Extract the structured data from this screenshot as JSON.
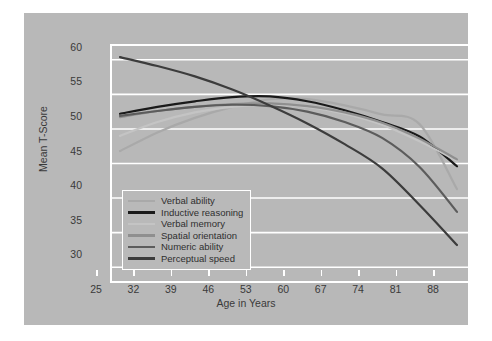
{
  "chart_data": {
    "type": "line",
    "title": "",
    "xlabel": "Age in Years",
    "ylabel": "Mean T-Score",
    "xticks": [
      25,
      32,
      39,
      46,
      53,
      60,
      67,
      74,
      81,
      88
    ],
    "yticks": [
      30,
      35,
      40,
      45,
      50,
      55,
      60
    ],
    "xlim": [
      25,
      88
    ],
    "ylim": [
      28,
      62
    ],
    "grid": true,
    "legend_position": "lower-left-inside",
    "x": [
      25,
      32,
      39,
      46,
      53,
      60,
      67,
      74,
      81,
      88
    ],
    "series": [
      {
        "name": "Verbal ability",
        "color": "#a9a9a9",
        "values": [
          46.8,
          49.5,
          51.6,
          53.2,
          54.3,
          54.3,
          53.4,
          52.1,
          50.7,
          41.3
        ]
      },
      {
        "name": "Inductive reasoning",
        "color": "#1a1a1a",
        "values": [
          52.2,
          53.2,
          54.0,
          54.6,
          54.7,
          54.0,
          52.7,
          51.0,
          48.9,
          44.6
        ]
      },
      {
        "name": "Verbal memory",
        "color": "#c4c4c4",
        "values": [
          49.0,
          51.0,
          52.4,
          53.2,
          53.5,
          53.2,
          52.2,
          50.6,
          48.2,
          45.4
        ]
      },
      {
        "name": "Spatial orientation",
        "color": "#8f8f8f",
        "values": [
          51.7,
          52.6,
          53.2,
          53.6,
          53.7,
          53.3,
          52.4,
          50.9,
          48.6,
          45.6
        ]
      },
      {
        "name": "Numeric ability",
        "color": "#5c5c5c",
        "values": [
          51.9,
          52.6,
          53.2,
          53.5,
          53.3,
          52.5,
          51.0,
          48.7,
          44.5,
          38.0
        ]
      },
      {
        "name": "Perceptual speed",
        "color": "#3c3c3c",
        "values": [
          60.4,
          59.1,
          57.6,
          55.7,
          53.4,
          50.8,
          47.8,
          44.3,
          39.0,
          33.2
        ]
      }
    ]
  },
  "legend": {
    "items": [
      {
        "label": "Verbal ability",
        "color": "#a9a9a9"
      },
      {
        "label": "Inductive reasoning",
        "color": "#1a1a1a"
      },
      {
        "label": "Verbal memory",
        "color": "#c4c4c4"
      },
      {
        "label": "Spatial orientation",
        "color": "#8f8f8f"
      },
      {
        "label": "Numeric ability",
        "color": "#5c5c5c"
      },
      {
        "label": "Perceptual speed",
        "color": "#3c3c3c"
      }
    ]
  },
  "axes": {
    "x_title": "Age in Years",
    "y_title": "Mean T-Score"
  },
  "colors": {
    "figure_background": "#b8b8b8",
    "page_background": "#ffffff",
    "gridline": "#ffffff",
    "tick_text": "#3a3a3a"
  }
}
